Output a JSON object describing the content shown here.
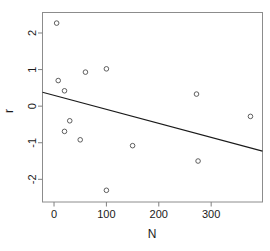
{
  "chart_data": {
    "type": "scatter",
    "title": "",
    "xlabel": "N",
    "ylabel": "r",
    "xlim": [
      -22,
      398
    ],
    "ylim": [
      -2.62,
      2.56
    ],
    "grid": false,
    "legend": null,
    "xticks": [
      0,
      100,
      200,
      300
    ],
    "xtick_labels": [
      "0",
      "100",
      "200",
      "300"
    ],
    "yticks": [
      -2,
      -1,
      0,
      1,
      2
    ],
    "ytick_labels": [
      "-2",
      "-1",
      "0",
      "1",
      "2"
    ],
    "point_marker": "open-circle",
    "point_color": "#4d4d4d",
    "line_color": "#1a1a1a",
    "axis_color": "#808080",
    "x": [
      5,
      8,
      20,
      20,
      30,
      50,
      60,
      100,
      100,
      150,
      272,
      275,
      375
    ],
    "y": [
      2.27,
      0.7,
      0.42,
      -0.69,
      -0.4,
      -0.92,
      0.93,
      1.02,
      -2.3,
      -1.08,
      0.33,
      -1.5,
      -0.28
    ],
    "series": [
      {
        "name": "observations",
        "type": "scatter",
        "points": [
          {
            "x": 5,
            "y": 2.27
          },
          {
            "x": 8,
            "y": 0.7
          },
          {
            "x": 20,
            "y": 0.42
          },
          {
            "x": 20,
            "y": -0.69
          },
          {
            "x": 30,
            "y": -0.4
          },
          {
            "x": 50,
            "y": -0.92
          },
          {
            "x": 60,
            "y": 0.93
          },
          {
            "x": 100,
            "y": 1.02
          },
          {
            "x": 100,
            "y": -2.3
          },
          {
            "x": 150,
            "y": -1.08
          },
          {
            "x": 272,
            "y": 0.33
          },
          {
            "x": 275,
            "y": -1.5
          },
          {
            "x": 375,
            "y": -0.28
          }
        ]
      },
      {
        "name": "regression-line",
        "type": "line",
        "endpoints": [
          {
            "x": -22,
            "y": 0.38
          },
          {
            "x": 398,
            "y": -1.23
          }
        ]
      }
    ]
  },
  "axes": {
    "x_title": "N",
    "y_title": "r"
  }
}
